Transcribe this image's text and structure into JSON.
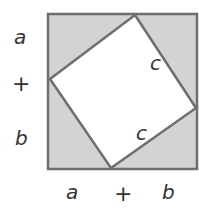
{
  "colors": {
    "shaded": "#d3d3d3",
    "inner": "#ffffff",
    "stroke": "#6e6e6e",
    "text": "#333333"
  },
  "outer_square": {
    "x": 48,
    "y": 14,
    "size": 149
  },
  "inner_square": {
    "points": [
      [
        135,
        15
      ],
      [
        196,
        108
      ],
      [
        111,
        168
      ],
      [
        50,
        79
      ]
    ]
  },
  "labels": {
    "left": {
      "top": "a",
      "middle": "+",
      "bottom": "b"
    },
    "bottom": {
      "left": "a",
      "middle": "+",
      "right": "b"
    },
    "inner": {
      "upper_right": "c",
      "lower": "c"
    }
  }
}
